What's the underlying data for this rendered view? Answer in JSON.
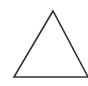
{
  "diagram": {
    "shape": "triangle",
    "fill": "#ffffff",
    "stroke": "#333333",
    "stroke_width": 1.6,
    "points": [
      [
        53,
        11
      ],
      [
        14,
        77
      ],
      [
        88,
        77
      ]
    ]
  }
}
